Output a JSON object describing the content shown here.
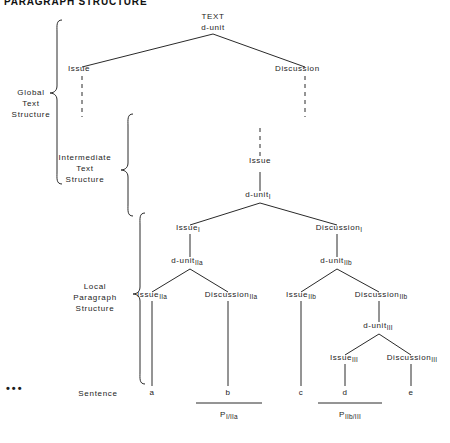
{
  "title": "PARAGRAPH STRUCTURE",
  "side_labels": [
    {
      "id": "global",
      "text": "Global\nText\nStructure"
    },
    {
      "id": "intermediate",
      "text": "Intermediate\nText\nStructure"
    },
    {
      "id": "local",
      "text": "Local\nParagraph\nStructure"
    },
    {
      "id": "sentence",
      "text": "Sentence"
    }
  ],
  "ellipsis": "•••",
  "nodes": {
    "root_line1": "TEXT",
    "root_line2": "d-unit",
    "global_issue": "Issue",
    "global_discussion": "Discussion",
    "inter_issue": "Issue",
    "d_unit_I": {
      "base": "d-unit",
      "sub": "I"
    },
    "issue_I": {
      "base": "Issue",
      "sub": "I"
    },
    "discussion_I": {
      "base": "Discussion",
      "sub": "I"
    },
    "d_unit_IIa": {
      "base": "d-unit",
      "sub": "IIa"
    },
    "issue_IIa": {
      "base": "Issue",
      "sub": "IIa"
    },
    "discussion_IIa": {
      "base": "Discussion",
      "sub": "IIa"
    },
    "d_unit_IIb": {
      "base": "d-unit",
      "sub": "IIb"
    },
    "issue_IIb": {
      "base": "Issue",
      "sub": "IIb"
    },
    "discussion_IIb": {
      "base": "Discussion",
      "sub": "IIb"
    },
    "d_unit_III": {
      "base": "d-unit",
      "sub": "III"
    },
    "issue_III": {
      "base": "Issue",
      "sub": "III"
    },
    "discussion_III": {
      "base": "Discussion",
      "sub": "III"
    }
  },
  "leaves": [
    "a",
    "b",
    "c",
    "d",
    "e"
  ],
  "paragraph_labels": [
    {
      "base": "P",
      "sub": "I/IIa"
    },
    {
      "base": "P",
      "sub": "IIb/III"
    }
  ],
  "colors": {
    "ink": "#1c1c1c",
    "line": "#2a2a2a",
    "background": "#ffffff"
  }
}
